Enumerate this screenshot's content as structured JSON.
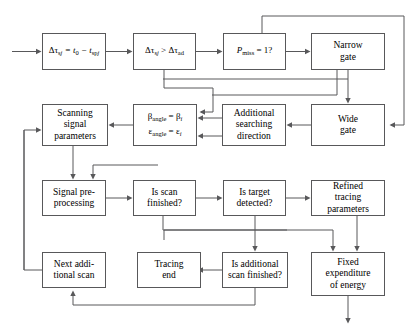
{
  "diagram": {
    "background": "#ffffff",
    "line_color": "#58585a",
    "text_color": "#000000",
    "nodes": [
      {
        "id": "dtau_eq",
        "label": "Δτ_sj = t_0 − t_sp_j",
        "row": 1,
        "col": 1
      },
      {
        "id": "dtau_cmp",
        "label": "Δτ_sj > Δτ_ad",
        "row": 1,
        "col": 2
      },
      {
        "id": "pmiss",
        "label": "P_miss = 1?",
        "row": 1,
        "col": 3
      },
      {
        "id": "narrow_gate",
        "label": "Narrow\ngate",
        "row": 1,
        "col": 4
      },
      {
        "id": "scanning",
        "label": "Scanning\nsignal\nparameters",
        "row": 2,
        "col": 1
      },
      {
        "id": "angles",
        "label": "β_angle = β_i\nε_angle = ε_i",
        "row": 2,
        "col": 2
      },
      {
        "id": "addsearch",
        "label": "Additional\nsearching\ndirection",
        "row": 2,
        "col": 3
      },
      {
        "id": "wide_gate",
        "label": "Wide\ngate",
        "row": 2,
        "col": 4
      },
      {
        "id": "signal_pre",
        "label": "Signal pre-\nprocessing",
        "row": 3,
        "col": 1
      },
      {
        "id": "is_scan_fin",
        "label": "Is scan\nfinished?",
        "row": 3,
        "col": 2
      },
      {
        "id": "is_target",
        "label": "Is target\ndetected?",
        "row": 3,
        "col": 3
      },
      {
        "id": "refined",
        "label": "Refined\ntracing\nparameters",
        "row": 3,
        "col": 4
      },
      {
        "id": "next_add",
        "label": "Next addi-\ntional scan",
        "row": 4,
        "col": 1
      },
      {
        "id": "tracing_end",
        "label": "Tracing\nend",
        "row": 4,
        "col": 2
      },
      {
        "id": "is_add_fin",
        "label": "Is additional\nscan finished?",
        "row": 4,
        "col": 3
      },
      {
        "id": "fixed_exp",
        "label": "Fixed\nexpenditure\nof energy",
        "row": 4,
        "col": 4
      }
    ],
    "labels": {
      "dtau_eq_pre": "Δτ",
      "dtau_eq_sub1": "sj",
      "dtau_eq_mid": " = t",
      "dtau_eq_sub2": "0",
      "dtau_eq_minus": " − t",
      "dtau_eq_sub3": "sp",
      "dtau_eq_sub4": "j",
      "dtau_cmp_pre": "Δτ",
      "dtau_cmp_sub1": "sj",
      "dtau_cmp_mid": " > Δτ",
      "dtau_cmp_sub2": "ad",
      "pmiss_p": "P",
      "pmiss_sub": "miss",
      "pmiss_rest": " = 1?",
      "beta_b": "β",
      "beta_sub": "angle",
      "beta_eq": " = β",
      "beta_i": "i",
      "eps_e": "ε",
      "eps_sub": "angle",
      "eps_eq": " = ε",
      "eps_i": "i",
      "narrow_gate": "Narrow\ngate",
      "wide_gate": "Wide\ngate",
      "scanning": "Scanning\nsignal\nparameters",
      "addsearch": "Additional\nsearching\ndirection",
      "signal_pre": "Signal pre-\nprocessing",
      "is_scan_fin": "Is scan\nfinished?",
      "is_target": "Is target\ndetected?",
      "refined": "Refined\ntracing\nparameters",
      "next_add": "Next addi-\ntional scan",
      "tracing_end": "Tracing\nend",
      "is_add_fin": "Is additional\nscan finished?",
      "fixed_exp": "Fixed\nexpenditure\nof energy"
    }
  }
}
